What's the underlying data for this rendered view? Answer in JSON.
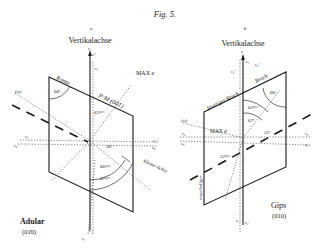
{
  "figure": {
    "title": "Fig. 5.",
    "panels": [
      {
        "id": "a",
        "letter": "a",
        "axis_label": "Vertikalachse",
        "mineral": "Adular",
        "face": "(01̄0)",
        "edge_labels": {
          "kante": "Kante",
          "pm": "P/M (001)",
          "kleine_achse": "Kleine Achse"
        },
        "annotation": "MAX e",
        "angles": [
          "64°",
          "63½°",
          "26°",
          "66½°",
          "67½°"
        ],
        "axis_symbols": [
          "c",
          "c'",
          "ε₁",
          "ε₂",
          "ε₃",
          "ε₁'",
          "ε₂'",
          "ε₃'",
          "(ω)"
        ]
      },
      {
        "id": "b",
        "letter": "b",
        "axis_label": "Vertikalachse",
        "mineral": "Gips",
        "face": "(010)",
        "edge_labels": {
          "faseriger_bruch": "faseriger Bruch",
          "bruch": "Bruch",
          "muscheliger": "muscheliger"
        },
        "annotation": "MAX e",
        "angles": [
          "66°",
          "63½°",
          "67°",
          "23°",
          "52½°"
        ],
        "axis_symbols": [
          "c",
          "ε₁",
          "ε₂",
          "ε₃",
          "ε₁'",
          "ε₂'",
          "ε₃'",
          "(ω)"
        ]
      }
    ]
  }
}
